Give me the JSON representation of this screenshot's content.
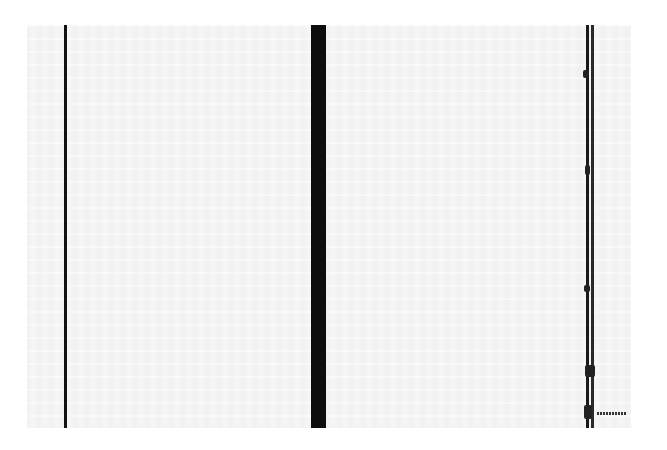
{
  "artwork": {
    "background_color": "#f3f3f3",
    "stripe_color": "#111111",
    "stripes": [
      {
        "name": "left-zip",
        "x": 64,
        "width": 3
      },
      {
        "name": "center-zip",
        "x": 311,
        "width": 15
      },
      {
        "name": "right-ragged-zip",
        "x": 585,
        "width": 10
      }
    ]
  }
}
